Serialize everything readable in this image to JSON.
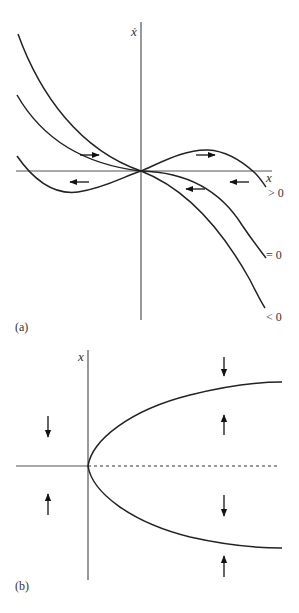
{
  "panel_a": {
    "caption": "(a)",
    "y_axis_label": "ẋ",
    "x_axis_label": "x",
    "curves": [
      {
        "id": "gt",
        "label": "> 0"
      },
      {
        "id": "eq",
        "label": "= 0"
      },
      {
        "id": "lt",
        "label": "< 0"
      }
    ]
  },
  "panel_b": {
    "caption": "(b)",
    "y_axis_label": "x"
  },
  "colors": {
    "curve": "#222222",
    "axis": "#555555",
    "background": "#ffffff"
  }
}
